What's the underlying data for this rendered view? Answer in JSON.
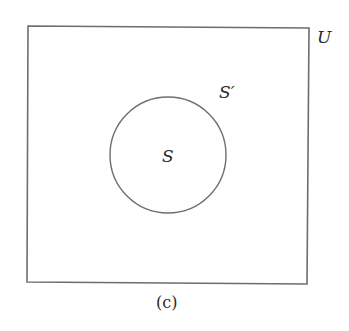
{
  "diagram": {
    "type": "venn",
    "caption": "(c)",
    "universe": {
      "label": "U",
      "rect": {
        "x1": 28,
        "y1": 26,
        "x2": 308,
        "y2": 283
      }
    },
    "set": {
      "label": "S",
      "circle": {
        "cx": 168,
        "cy": 155,
        "r": 58
      }
    },
    "complement": {
      "label": "S′"
    },
    "colors": {
      "stroke": "#6e6e6e",
      "text": "#2a2a2a",
      "background": "#ffffff"
    }
  }
}
